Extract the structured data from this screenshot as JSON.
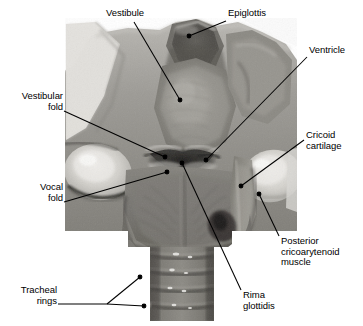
{
  "figure": {
    "media_type": "anatomical-photograph",
    "color_mode": "grayscale",
    "width_px": 363,
    "height_px": 326,
    "background_color": "#ffffff",
    "label_color": "#000000",
    "leader_color": "#000000"
  },
  "labels": [
    {
      "id": "vestibule",
      "text": "Vestibule",
      "lines": [
        "Vestibule"
      ],
      "align": "left",
      "x": 106,
      "y": 8,
      "leader": {
        "x1": 134,
        "y1": 22,
        "x2": 180,
        "y2": 100
      },
      "dot": {
        "x": 180,
        "y": 100
      }
    },
    {
      "id": "epiglottis",
      "text": "Epiglottis",
      "lines": [
        "Epiglottis"
      ],
      "align": "left",
      "x": 228,
      "y": 8,
      "leader": {
        "x1": 226,
        "y1": 21,
        "x2": 189,
        "y2": 36
      },
      "dot": {
        "x": 189,
        "y": 36
      }
    },
    {
      "id": "ventricle",
      "text": "Ventricle",
      "lines": [
        "Ventricle"
      ],
      "align": "left",
      "x": 309,
      "y": 45,
      "leader": {
        "x1": 307,
        "y1": 57,
        "x2": 206,
        "y2": 160
      },
      "dot": {
        "x": 206,
        "y": 160
      }
    },
    {
      "id": "vestibular-fold",
      "text": "Vestibular fold",
      "lines": [
        "Vestibular",
        "fold"
      ],
      "align": "right",
      "x": 8,
      "y": 91,
      "x_right": 63,
      "leader": {
        "x1": 64,
        "y1": 111,
        "x2": 165,
        "y2": 157
      },
      "dot": {
        "x": 165,
        "y": 157
      }
    },
    {
      "id": "cricoid-cartilage",
      "text": "Cricoid cartilage",
      "lines": [
        "Cricoid",
        "cartilage"
      ],
      "align": "left",
      "x": 306,
      "y": 130,
      "leader": {
        "x1": 304,
        "y1": 140,
        "x2": 241,
        "y2": 186
      },
      "dot": {
        "x": 241,
        "y": 186
      }
    },
    {
      "id": "vocal-fold",
      "text": "Vocal fold",
      "lines": [
        "Vocal",
        "fold"
      ],
      "align": "right",
      "x": 8,
      "y": 182,
      "x_right": 63,
      "leader": {
        "x1": 64,
        "y1": 202,
        "x2": 167,
        "y2": 172
      },
      "dot": {
        "x": 167,
        "y": 172
      }
    },
    {
      "id": "posterior-cricoarytenoid-muscle",
      "text": "Posterior cricoarytenoid muscle",
      "lines": [
        "Posterior",
        "cricoarytenoid",
        "muscle"
      ],
      "align": "left",
      "x": 281,
      "y": 236,
      "leader": {
        "x1": 279,
        "y1": 236,
        "x2": 259,
        "y2": 194
      },
      "dot": {
        "x": 259,
        "y": 194
      }
    },
    {
      "id": "rima-glottidis",
      "text": "Rima glottidis",
      "lines": [
        "Rima",
        "glottidis"
      ],
      "align": "left",
      "x": 243,
      "y": 290,
      "leader": {
        "x1": 241,
        "y1": 290,
        "x2": 182,
        "y2": 163
      },
      "dot": {
        "x": 182,
        "y": 163
      }
    },
    {
      "id": "tracheal-rings",
      "text": "Tracheal rings",
      "lines": [
        "Tracheal",
        "rings"
      ],
      "align": "right",
      "x": 8,
      "y": 285,
      "x_right": 57,
      "leader": {
        "x1": 58,
        "y1": 304,
        "x2": 107,
        "y2": 304
      },
      "leader_branch_a": {
        "x1": 107,
        "y1": 304,
        "x2": 140,
        "y2": 277
      },
      "leader_branch_b": {
        "x1": 107,
        "y1": 304,
        "x2": 144,
        "y2": 306
      },
      "dot": {
        "x": 140,
        "y": 277
      },
      "dot_b": {
        "x": 144,
        "y": 306
      }
    }
  ],
  "specimen": {
    "structures": [
      "epiglottis",
      "vestibule",
      "vestibular fold",
      "vocal fold",
      "rima glottidis",
      "ventricle",
      "cricoid cartilage",
      "posterior cricoarytenoid muscle",
      "tracheal rings"
    ]
  }
}
